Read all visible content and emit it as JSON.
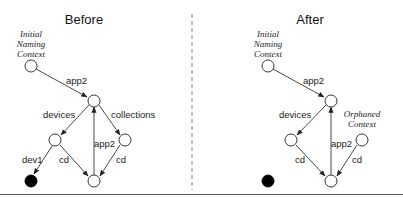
{
  "panels": [
    {
      "title": "Before",
      "root_label": [
        "Initial",
        "Naming",
        "Context"
      ],
      "edges": {
        "root_to_top": "app2",
        "top_to_devices": "devices",
        "top_to_collections": "collections",
        "bottom_to_top": "app2",
        "devices_to_dev": "dev1",
        "devices_to_bottom": "cd",
        "collections_to_bottom": "cd"
      }
    },
    {
      "title": "After",
      "root_label": [
        "Initial",
        "Naming",
        "Context"
      ],
      "orphan_label": [
        "Orphaned",
        "Context"
      ],
      "edges": {
        "root_to_top": "app2",
        "top_to_devices": "devices",
        "bottom_to_top": "app2",
        "devices_to_bottom": "cd",
        "orphan_to_bottom": "cd"
      }
    }
  ]
}
